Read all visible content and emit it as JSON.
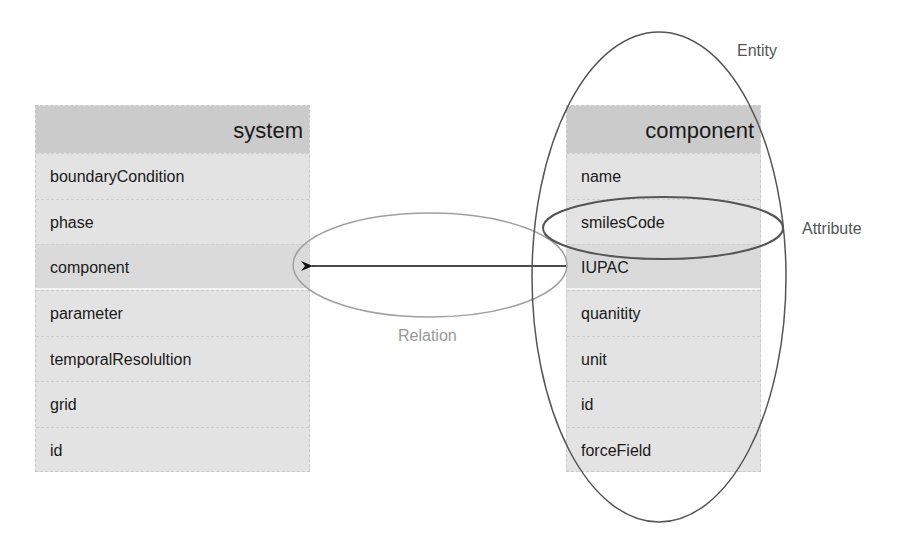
{
  "diagram": {
    "type": "entity-relationship",
    "tables": [
      {
        "name": "system",
        "fields": [
          "boundaryCondition",
          "phase",
          "component",
          "parameter",
          "temporalResolultion",
          "grid",
          "id"
        ],
        "highlighted_field": "component"
      },
      {
        "name": "component",
        "fields": [
          "name",
          "smilesCode",
          "IUPAC",
          "quanitity",
          "unit",
          "id",
          "forceField"
        ],
        "highlighted_field": "IUPAC"
      }
    ],
    "annotations": {
      "entity": "Entity",
      "attribute": "Attribute",
      "relation": "Relation"
    },
    "relation": {
      "from": "component.IUPAC",
      "to": "system.component"
    },
    "colors": {
      "header_bg": "#cbcbcb",
      "row_bg": "#e3e3e3",
      "ellipse_dark": "#555555",
      "ellipse_light": "#a0a0a0",
      "relation_text": "#999999",
      "label_text": "#555555"
    }
  }
}
